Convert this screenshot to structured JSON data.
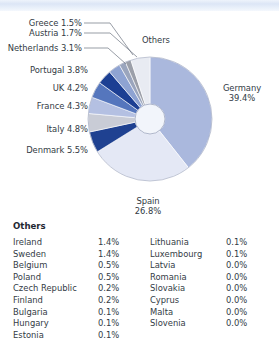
{
  "chart_data": {
    "type": "pie",
    "variant": "donut",
    "title": "",
    "unit": "%",
    "categories": [
      "Germany",
      "Spain",
      "Denmark",
      "Italy",
      "France",
      "UK",
      "Portugal",
      "Netherlands",
      "Austria",
      "Greece",
      "Others"
    ],
    "values": [
      39.4,
      26.8,
      5.5,
      4.8,
      4.3,
      4.2,
      3.8,
      3.1,
      1.7,
      1.5,
      5.0
    ],
    "colors": [
      "#aab8dd",
      "#e4e8f5",
      "#1f4191",
      "#c9ccd6",
      "#b4c0e2",
      "#5576bd",
      "#1c3f93",
      "#8ea3d2",
      "#9aa5bd",
      "#9b9fa9",
      "#e8ebf2"
    ],
    "labels": [
      {
        "name": "Germany",
        "value": "39.4%",
        "display": "Germany\n39.4%"
      },
      {
        "name": "Spain",
        "value": "26.8%",
        "display": "Spain\n26.8%"
      },
      {
        "name": "Denmark",
        "value": "5.5%",
        "display": "Denmark 5.5%"
      },
      {
        "name": "Italy",
        "value": "4.8%",
        "display": "Italy 4.8%"
      },
      {
        "name": "France",
        "value": "4.3%",
        "display": "France 4.3%"
      },
      {
        "name": "UK",
        "value": "4.2%",
        "display": "UK 4.2%"
      },
      {
        "name": "Portugal",
        "value": "3.8%",
        "display": "Portugal 3.8%"
      },
      {
        "name": "Netherlands",
        "value": "3.1%",
        "display": "Netherlands 3.1%"
      },
      {
        "name": "Austria",
        "value": "1.7%",
        "display": "Austria 1.7%"
      },
      {
        "name": "Greece",
        "value": "1.5%",
        "display": "Greece 1.5%"
      },
      {
        "name": "Others",
        "value": "",
        "display": "Others"
      }
    ],
    "legend": "inline-labels",
    "grid": false
  },
  "slice_labels": {
    "germany_name": "Germany",
    "germany_value": "39.4%",
    "spain_name": "Spain",
    "spain_value": "26.8%",
    "denmark": "Denmark 5.5%",
    "italy": "Italy 4.8%",
    "france": "France 4.3%",
    "uk": "UK 4.2%",
    "portugal": "Portugal 3.8%",
    "netherlands": "Netherlands 3.1%",
    "austria": "Austria 1.7%",
    "greece": "Greece 1.5%",
    "others": "Others"
  },
  "others_table": {
    "title": "Others",
    "left_column": [
      {
        "name": "Ireland",
        "pct": "1.4%"
      },
      {
        "name": "Sweden",
        "pct": "1.4%"
      },
      {
        "name": "Belgium",
        "pct": "0.5%"
      },
      {
        "name": "Poland",
        "pct": "0.5%"
      },
      {
        "name": "Czech Republic",
        "pct": "0.2%"
      },
      {
        "name": "Finland",
        "pct": "0.2%"
      },
      {
        "name": "Bulgaria",
        "pct": "0.1%"
      },
      {
        "name": "Hungary",
        "pct": "0.1%"
      },
      {
        "name": "Estonia",
        "pct": "0.1%"
      }
    ],
    "right_column": [
      {
        "name": "Lithuania",
        "pct": "0.1%"
      },
      {
        "name": "Luxembourg",
        "pct": "0.1%"
      },
      {
        "name": "Latvia",
        "pct": "0.0%"
      },
      {
        "name": "Romania",
        "pct": "0.0%"
      },
      {
        "name": "Slovakia",
        "pct": "0.0%"
      },
      {
        "name": "Cyprus",
        "pct": "0.0%"
      },
      {
        "name": "Malta",
        "pct": "0.0%"
      },
      {
        "name": "Slovenia",
        "pct": "0.0%"
      },
      {
        "name": "",
        "pct": ""
      }
    ]
  }
}
